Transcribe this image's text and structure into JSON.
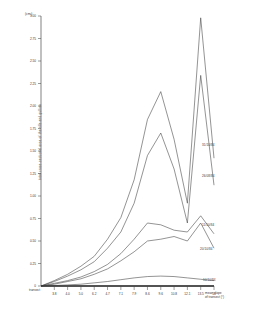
{
  "chart_data": {
    "type": "line",
    "title": "",
    "ylabel": "total cross-sectional area of the rills and gullies",
    "yunit": "(cm²)",
    "xlabel": "mean slope of transect (°)",
    "xlabel_line1": "mean slope",
    "xlabel_line2": "of transect (°)",
    "transect_label": "transect",
    "ylim": [
      0,
      3.0
    ],
    "ytick_labels": [
      "3.00",
      "2.75",
      "2.50",
      "2.25",
      "2.00",
      "1.75",
      "1.50",
      "1.25",
      "1.00",
      "0.75",
      "0.50",
      "0.25",
      "0"
    ],
    "ytick_values": [
      3.0,
      2.75,
      2.5,
      2.25,
      2.0,
      1.75,
      1.5,
      1.25,
      1.0,
      0.75,
      0.5,
      0.25,
      0
    ],
    "ytick_shown": [
      "3.00",
      "2.75",
      "2.50",
      "2.25",
      "2.00",
      "1.75",
      "1.50",
      "1.25",
      "1.00",
      "0.75",
      "0.50",
      "0.25",
      "0"
    ],
    "xtick_labels": [
      "3.8",
      "4.0",
      "5.0",
      "6.2",
      "4.7",
      "7.1",
      "7.9",
      "8.6",
      "9.6",
      "10.8",
      "12.1",
      "13.5",
      "14"
    ],
    "transect_numbers": [
      "1",
      "2",
      "3",
      "4",
      "5",
      "6",
      "7",
      "8",
      "9",
      "10",
      "11",
      "12",
      "13"
    ],
    "grid": false,
    "legend_position": "right-inline",
    "series": [
      {
        "name": "31/10/84",
        "label": "31/10/84",
        "values": [
          0.0,
          0.06,
          0.13,
          0.22,
          0.33,
          0.52,
          0.76,
          1.18,
          1.85,
          2.16,
          1.63,
          0.92,
          2.98,
          1.42
        ]
      },
      {
        "name": "26/08/84",
        "label": "26/08/84",
        "values": [
          0.0,
          0.05,
          0.11,
          0.18,
          0.27,
          0.42,
          0.6,
          0.92,
          1.45,
          1.7,
          1.3,
          0.7,
          2.34,
          1.12
        ]
      },
      {
        "name": "11/10/84",
        "label": "11/10/84",
        "values": [
          0.0,
          0.03,
          0.06,
          0.1,
          0.16,
          0.24,
          0.36,
          0.52,
          0.7,
          0.68,
          0.62,
          0.6,
          0.78,
          0.58
        ]
      },
      {
        "name": "20/10/84",
        "label": "20/10/84",
        "values": [
          0.0,
          0.02,
          0.05,
          0.08,
          0.13,
          0.19,
          0.28,
          0.38,
          0.5,
          0.52,
          0.55,
          0.5,
          0.7,
          0.42
        ]
      },
      {
        "name": "10/10/84",
        "label": "10/10/84",
        "values": [
          0.0,
          0.005,
          0.012,
          0.02,
          0.035,
          0.05,
          0.07,
          0.09,
          0.105,
          0.11,
          0.105,
          0.09,
          0.075,
          0.06
        ]
      }
    ],
    "series_label_positions": [
      {
        "name": "31/10/84",
        "x": 202,
        "y": 143
      },
      {
        "name": "26/08/84",
        "x": 202,
        "y": 174
      },
      {
        "name": "11/10/84",
        "x": 202,
        "y": 223
      },
      {
        "name": "20/10/84",
        "x": 200,
        "y": 247
      },
      {
        "name": "10/10/84",
        "x": 203,
        "y": 278
      }
    ]
  }
}
